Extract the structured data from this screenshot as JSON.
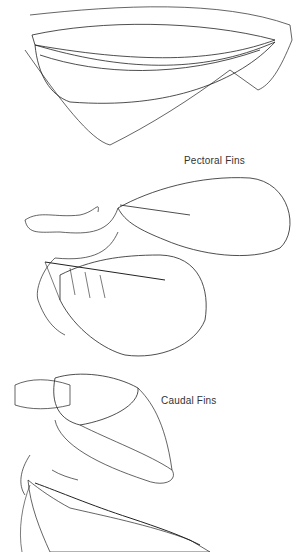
{
  "figure": {
    "colors": {
      "background": "#ffffff",
      "ink": "#222222",
      "label": "#333333"
    },
    "labels": [
      {
        "id": "pectoral",
        "text": "Pectoral Fins"
      },
      {
        "id": "caudal",
        "text": "Caudal Fins"
      }
    ],
    "panels": [
      {
        "name": "dorsal-fin-top",
        "description": "elongated fin with rays, top"
      },
      {
        "name": "pectoral-fin-upper",
        "group": "Pectoral Fins"
      },
      {
        "name": "pectoral-fin-lower",
        "group": "Pectoral Fins"
      },
      {
        "name": "caudal-fin-upper",
        "group": "Caudal Fins"
      },
      {
        "name": "caudal-fin-lower",
        "group": "Caudal Fins"
      }
    ]
  }
}
